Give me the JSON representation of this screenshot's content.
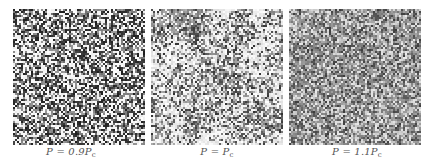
{
  "figure": {
    "panels": [
      {
        "id": "p09",
        "label_prefix": "P = 0.9P",
        "label_sub": "c",
        "density_white": 0.38,
        "cluster_strength": 0.05,
        "contrast": "high",
        "left": 13
      },
      {
        "id": "p10",
        "label_prefix": "P = P",
        "label_sub": "c",
        "density_white": 0.45,
        "cluster_strength": 0.55,
        "contrast": "medium",
        "left": 151
      },
      {
        "id": "p11",
        "label_prefix": "P = 1.1P",
        "label_sub": "c",
        "density_white": 0.3,
        "cluster_strength": 0.15,
        "contrast": "low",
        "left": 289
      }
    ]
  }
}
